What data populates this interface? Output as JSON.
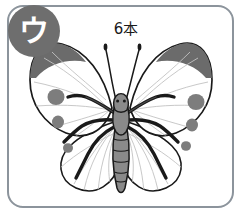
{
  "card": {
    "title": "butterfly-anatomy-card",
    "badge": {
      "letter": "ウ",
      "color": "#6e6e6e",
      "text_color": "#ffffff"
    },
    "frame": {
      "border_color": "#8c949c",
      "background": "#ffffff",
      "corner_radius": "16px"
    },
    "annotation": {
      "label": "6本",
      "color": "#1a1a1a",
      "leader_target": "antennae"
    },
    "illustration": {
      "subject": "butterfly",
      "body_color": "#8a8a8a",
      "outline_color": "#1a1a1a",
      "wing_fill": "#ffffff",
      "wing_vein_color": "#b9b9b9",
      "spot_color": "#7d7d7d",
      "wingtip_color": "#6b6b6b",
      "leg_color": "#1a1a1a",
      "leg_count": 6,
      "antenna_count": 2,
      "spots_left": 3,
      "spots_right": 3
    }
  }
}
